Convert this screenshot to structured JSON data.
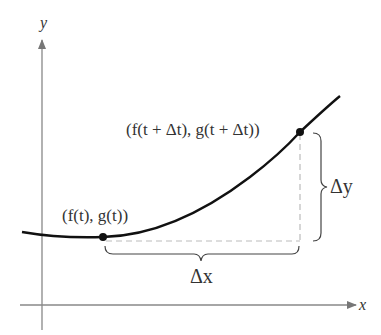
{
  "diagram": {
    "axes": {
      "x_label": "x",
      "y_label": "y"
    },
    "points": [
      {
        "label": "(f(t), g(t))",
        "x": 103,
        "y": 237
      },
      {
        "label": "(f(t + Δt), g(t + Δt))",
        "x": 300,
        "y": 132
      }
    ],
    "braces": {
      "horizontal_label": "Δx",
      "vertical_label": "Δy"
    },
    "colors": {
      "axis": "#888888",
      "curve": "#111111",
      "dashed": "#bbbbbb",
      "text": "#333333"
    }
  }
}
